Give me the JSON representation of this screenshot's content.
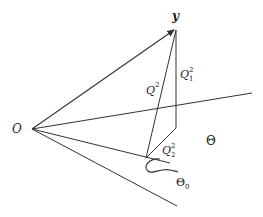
{
  "diagram": {
    "labels": {
      "origin": "O",
      "vector_y": "y",
      "q_total": "Q",
      "q_total_sup": "2",
      "q1": "Q",
      "q1_sup": "2",
      "q1_sub": "1",
      "q2": "Q",
      "q2_sup": "2",
      "q2_sub": "2",
      "theta": "Θ",
      "theta0": "Θ",
      "theta0_sub": "0"
    },
    "colors": {
      "line": "#333333",
      "text": "#222222",
      "background": "#ffffff"
    }
  }
}
